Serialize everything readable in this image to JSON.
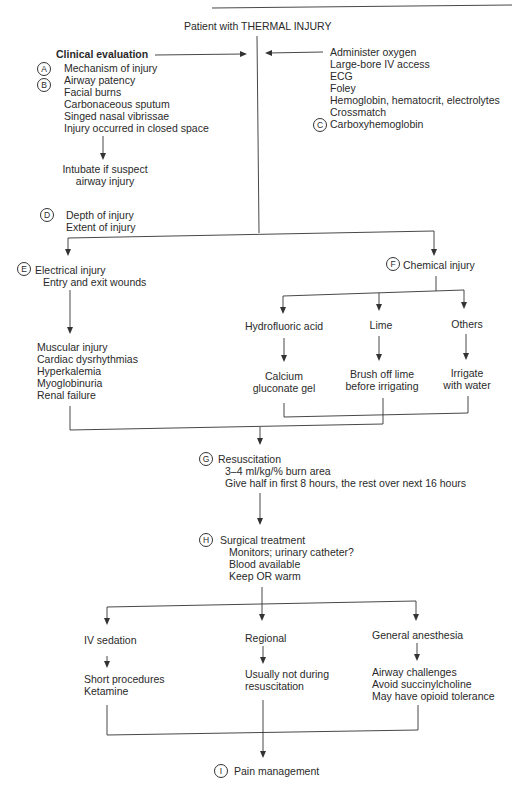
{
  "header": {
    "running_title_partial": "THERMAL INJURY"
  },
  "start": {
    "label": "Patient with THERMAL INJURY"
  },
  "clinical_evaluation": {
    "title": "Clinical evaluation",
    "marker_a": "A",
    "marker_b": "B",
    "items": [
      "Mechanism of injury",
      "Airway patency",
      "Facial burns",
      "Carbonaceous sputum",
      "Singed nasal vibrissae",
      "Injury occurred in closed space"
    ],
    "outcome": [
      "Intubate if suspect",
      "airway injury"
    ]
  },
  "initial_management": {
    "marker_c": "C",
    "items": [
      "Administer oxygen",
      "Large-bore IV access",
      "ECG",
      "Foley",
      "Hemoglobin, hematocrit, electrolytes",
      "Crossmatch",
      "Carboxyhemoglobin"
    ]
  },
  "assessment": {
    "marker": "D",
    "items": [
      "Depth of injury",
      "Extent of injury"
    ]
  },
  "electrical": {
    "marker": "E",
    "title": "Electrical injury",
    "subtitle": "Entry and exit wounds",
    "complications": [
      "Muscular injury",
      "Cardiac dysrhythmias",
      "Hyperkalemia",
      "Myoglobinuria",
      "Renal failure"
    ]
  },
  "chemical": {
    "marker": "F",
    "title": "Chemical injury",
    "branches": [
      {
        "agent": "Hydrofluoric acid",
        "treatment": [
          "Calcium",
          "gluconate gel"
        ]
      },
      {
        "agent": "Lime",
        "treatment": [
          "Brush off lime",
          "before irrigating"
        ]
      },
      {
        "agent": "Others",
        "treatment": [
          "Irrigate",
          "with water"
        ]
      }
    ]
  },
  "resuscitation": {
    "marker": "G",
    "title": "Resuscitation",
    "items": [
      "3–4 ml/kg/% burn area",
      "Give half in first 8 hours, the rest over next 16 hours"
    ]
  },
  "surgical": {
    "marker": "H",
    "title": "Surgical treatment",
    "items": [
      "Monitors; urinary catheter?",
      "Blood available",
      "Keep OR warm"
    ]
  },
  "anesthesia": [
    {
      "title": "IV sedation",
      "notes": [
        "Short procedures",
        "Ketamine"
      ]
    },
    {
      "title": "Regional",
      "notes": [
        "Usually not during",
        "resuscitation"
      ]
    },
    {
      "title": "General anesthesia",
      "notes": [
        "Airway challenges",
        "Avoid succinylcholine",
        "May have opioid tolerance"
      ]
    }
  ],
  "pain": {
    "marker": "I",
    "title": "Pain management"
  }
}
